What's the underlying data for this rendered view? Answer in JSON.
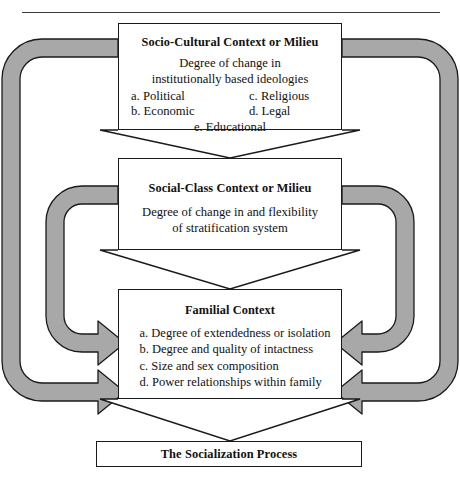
{
  "diagram": {
    "name": "socialization-context-model",
    "colors": {
      "band_fill": "#a8a8a8",
      "band_stroke": "#1a1a1a",
      "box_stroke": "#1a1a1a",
      "box_fill": "#ffffff",
      "text": "#111111",
      "rule": "#3a3a3a"
    }
  },
  "nodes": {
    "socio": {
      "title": "Socio-Cultural Context or Milieu",
      "sub_line1": "Degree of change in",
      "sub_line2": "institutionally based ideologies",
      "items_left": [
        "a. Political",
        "b. Economic"
      ],
      "items_right": [
        "c. Religious",
        "d. Legal"
      ],
      "item_center": "e. Educational"
    },
    "social_class": {
      "title": "Social-Class Context or Milieu",
      "sub_line1": "Degree of change in and flexibility",
      "sub_line2": "of stratification system"
    },
    "familial": {
      "title": "Familial Context",
      "items": [
        "a. Degree of extendedness or isolation",
        "b. Degree and quality of intactness",
        "c. Size and sex composition",
        "d. Power relationships within family"
      ]
    },
    "socialization": {
      "title": "The Socialization Process"
    }
  },
  "connectors": {
    "funnel_socio_to_class": "funnel-arrow-down",
    "funnel_class_to_family": "funnel-arrow-down",
    "funnel_family_to_socialization": "funnel-arrow-down",
    "band_outer_left": "feedback-band-socio-to-familial-left",
    "band_outer_right": "feedback-band-socio-to-familial-right",
    "band_inner_left": "feedback-band-class-to-familial-left",
    "band_inner_right": "feedback-band-class-to-familial-right"
  }
}
